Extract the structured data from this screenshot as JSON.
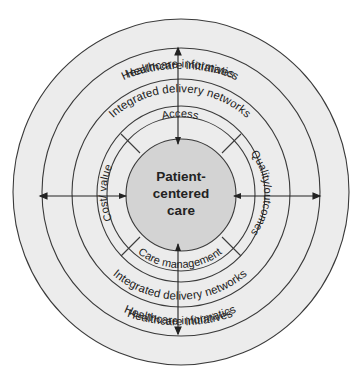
{
  "diagram": {
    "center": {
      "lines": [
        "Patient-",
        "centered",
        "care"
      ]
    },
    "inner_band": {
      "top": "Access",
      "right": "Quality/outcomes",
      "bottom": "Care management",
      "left": "Cost/ value"
    },
    "rings": {
      "idn_top": "Integrated delivery networks",
      "idn_bottom": "Integrated delivery networks",
      "informatics_top": "Healthcare informatics",
      "informatics_bottom": "Healthcare informatics",
      "initiatives_top": "Healthcare initiatives",
      "initiatives_bottom": "Healthcare initiatives"
    },
    "arrows": [
      "top-to-center",
      "bottom-to-center",
      "left-right-double",
      "right-left-double"
    ],
    "colors": {
      "background": "#ffffff",
      "rings_fill": "#ececec",
      "center_fill": "#d3d3d3",
      "stroke": "#3a3a3a",
      "text": "#222222"
    }
  }
}
